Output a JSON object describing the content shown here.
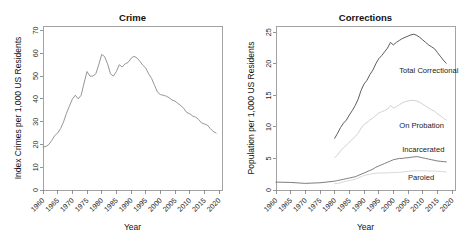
{
  "figure": {
    "width": 465,
    "height": 241,
    "background": "#ffffff"
  },
  "chart_data": [
    {
      "type": "line",
      "id": "crime",
      "title": "Crime",
      "xlabel": "Year",
      "ylabel": "Index Crimes per 1,000 US Residents",
      "xlim": [
        1960,
        2021
      ],
      "ylim": [
        0,
        72
      ],
      "grid": false,
      "legend_position": "none",
      "xticks": [
        1960,
        1965,
        1970,
        1975,
        1980,
        1985,
        1990,
        1995,
        2000,
        2005,
        2010,
        2015,
        2020
      ],
      "xtick_labels": [
        "1960",
        "1965",
        "1970",
        "1975",
        "1980",
        "1985",
        "1990",
        "1995",
        "2000",
        "2005",
        "2010",
        "2015",
        "2020"
      ],
      "xtick_rotation": 45,
      "yticks": [
        0,
        10,
        20,
        30,
        40,
        50,
        60,
        70
      ],
      "ytick_labels": [
        "0",
        "10",
        "20",
        "30",
        "40",
        "50",
        "60",
        "70"
      ],
      "series": [
        {
          "name": "Index Crime Rate",
          "color": "#8a8a8a",
          "x": [
            1960,
            1961,
            1962,
            1963,
            1964,
            1965,
            1966,
            1967,
            1968,
            1969,
            1970,
            1971,
            1972,
            1973,
            1974,
            1975,
            1976,
            1977,
            1978,
            1979,
            1980,
            1981,
            1982,
            1983,
            1984,
            1985,
            1986,
            1987,
            1988,
            1989,
            1990,
            1991,
            1992,
            1993,
            1994,
            1995,
            1996,
            1997,
            1998,
            1999,
            2000,
            2001,
            2002,
            2003,
            2004,
            2005,
            2006,
            2007,
            2008,
            2009,
            2010,
            2011,
            2012,
            2013,
            2014,
            2015,
            2016,
            2017,
            2018,
            2019
          ],
          "values": [
            18.9,
            19.1,
            20.0,
            21.8,
            23.9,
            25.0,
            27.0,
            29.9,
            33.7,
            36.8,
            39.9,
            41.6,
            40.0,
            41.6,
            47.0,
            52.0,
            50.0,
            50.0,
            51.0,
            55.0,
            59.5,
            58.6,
            55.4,
            51.0,
            50.0,
            52.0,
            55.0,
            54.0,
            55.4,
            56.0,
            57.8,
            58.7,
            58.0,
            56.5,
            54.8,
            53.6,
            51.0,
            49.0,
            46.0,
            43.0,
            41.9,
            41.6,
            41.2,
            40.5,
            39.5,
            39.0,
            38.0,
            37.0,
            35.8,
            34.0,
            33.5,
            32.5,
            32.0,
            31.0,
            29.5,
            29.0,
            28.5,
            27.0,
            25.7,
            25.0
          ]
        }
      ]
    },
    {
      "type": "line",
      "id": "corrections",
      "title": "Corrections",
      "xlabel": "Year",
      "ylabel": "Population per 1,000 US Residents",
      "xlim": [
        1960,
        2021
      ],
      "ylim": [
        0,
        26
      ],
      "grid": false,
      "legend_position": "inline-right",
      "xticks": [
        1960,
        1965,
        1970,
        1975,
        1980,
        1985,
        1990,
        1995,
        2000,
        2005,
        2010,
        2015,
        2020
      ],
      "xtick_labels": [
        "1960",
        "1965",
        "1970",
        "1975",
        "1980",
        "1985",
        "1990",
        "1995",
        "2000",
        "2005",
        "2010",
        "2015",
        "2020"
      ],
      "xtick_rotation": 45,
      "yticks": [
        0,
        5,
        10,
        15,
        20,
        25
      ],
      "ytick_labels": [
        "0",
        "5",
        "10",
        "15",
        "20",
        "25"
      ],
      "series": [
        {
          "name": "Total Correctional",
          "label": "Total Correctional",
          "color": "#4a4a4a",
          "label_x": 2002,
          "label_y": 18.6,
          "x": [
            1980,
            1981,
            1982,
            1983,
            1984,
            1985,
            1986,
            1987,
            1988,
            1989,
            1990,
            1991,
            1992,
            1993,
            1994,
            1995,
            1996,
            1997,
            1998,
            1999,
            2000,
            2001,
            2002,
            2003,
            2004,
            2005,
            2006,
            2007,
            2008,
            2009,
            2010,
            2011,
            2012,
            2013,
            2014,
            2015,
            2016,
            2017,
            2018
          ],
          "values": [
            8.2,
            9.0,
            9.9,
            10.6,
            11.1,
            11.9,
            12.6,
            13.4,
            14.4,
            15.8,
            16.8,
            17.4,
            18.3,
            19.0,
            20.0,
            20.8,
            21.3,
            21.9,
            22.5,
            23.4,
            23.0,
            23.4,
            23.7,
            24.0,
            24.2,
            24.4,
            24.6,
            24.7,
            24.5,
            24.2,
            23.8,
            23.4,
            23.0,
            22.7,
            22.4,
            21.8,
            21.2,
            20.6,
            20.1
          ]
        },
        {
          "name": "On Probation",
          "label": "On Probation",
          "color": "#cccccc",
          "label_x": 2002,
          "label_y": 9.9,
          "x": [
            1980,
            1981,
            1982,
            1983,
            1984,
            1985,
            1986,
            1987,
            1988,
            1989,
            1990,
            1991,
            1992,
            1993,
            1994,
            1995,
            1996,
            1997,
            1998,
            1999,
            2000,
            2001,
            2002,
            2003,
            2004,
            2005,
            2006,
            2007,
            2008,
            2009,
            2010,
            2011,
            2012,
            2013,
            2014,
            2015,
            2016,
            2017,
            2018
          ],
          "values": [
            5.1,
            5.6,
            6.2,
            6.7,
            7.1,
            7.6,
            8.0,
            8.5,
            9.0,
            9.8,
            10.4,
            10.7,
            11.1,
            11.4,
            11.8,
            12.2,
            12.4,
            12.6,
            12.8,
            13.4,
            13.0,
            13.2,
            13.5,
            13.8,
            14.0,
            14.1,
            14.2,
            14.2,
            14.1,
            13.9,
            13.6,
            13.3,
            13.0,
            12.7,
            12.5,
            12.1,
            11.8,
            11.4,
            11.1
          ]
        },
        {
          "name": "Incarcerated",
          "label": "Incarcerated",
          "color": "#6e6e6e",
          "label_x": 2003,
          "label_y": 6.1,
          "x": [
            1960,
            1965,
            1970,
            1975,
            1980,
            1981,
            1982,
            1983,
            1984,
            1985,
            1986,
            1987,
            1988,
            1989,
            1990,
            1991,
            1992,
            1993,
            1994,
            1995,
            1996,
            1997,
            1998,
            1999,
            2000,
            2001,
            2002,
            2003,
            2004,
            2005,
            2006,
            2007,
            2008,
            2009,
            2010,
            2011,
            2012,
            2013,
            2014,
            2015,
            2016,
            2017,
            2018
          ],
          "values": [
            1.25,
            1.2,
            1.05,
            1.15,
            1.4,
            1.5,
            1.6,
            1.7,
            1.8,
            1.9,
            2.0,
            2.1,
            2.3,
            2.5,
            2.7,
            2.9,
            3.1,
            3.3,
            3.6,
            3.8,
            4.0,
            4.2,
            4.4,
            4.6,
            4.8,
            4.9,
            5.0,
            5.0,
            5.1,
            5.1,
            5.2,
            5.25,
            5.3,
            5.2,
            5.1,
            5.0,
            4.9,
            4.8,
            4.7,
            4.6,
            4.55,
            4.5,
            4.45
          ]
        },
        {
          "name": "Paroled",
          "label": "Paroled",
          "color": "#d4d4d4",
          "label_x": 2005,
          "label_y": 1.55,
          "x": [
            1980,
            1981,
            1982,
            1983,
            1984,
            1985,
            1986,
            1987,
            1988,
            1989,
            1990,
            1991,
            1992,
            1993,
            1994,
            1995,
            1996,
            1997,
            1998,
            1999,
            2000,
            2001,
            2002,
            2003,
            2004,
            2005,
            2006,
            2007,
            2008,
            2009,
            2010,
            2011,
            2012,
            2013,
            2014,
            2015,
            2016,
            2017,
            2018
          ],
          "values": [
            1.0,
            1.05,
            1.15,
            1.3,
            1.4,
            1.5,
            1.6,
            1.7,
            1.9,
            2.1,
            2.3,
            2.4,
            2.5,
            2.6,
            2.65,
            2.7,
            2.7,
            2.7,
            2.7,
            2.75,
            2.75,
            2.8,
            2.8,
            2.85,
            2.9,
            2.95,
            3.0,
            3.05,
            3.05,
            3.05,
            3.05,
            3.05,
            3.0,
            3.0,
            3.0,
            2.95,
            2.95,
            2.9,
            2.85
          ]
        }
      ]
    }
  ]
}
